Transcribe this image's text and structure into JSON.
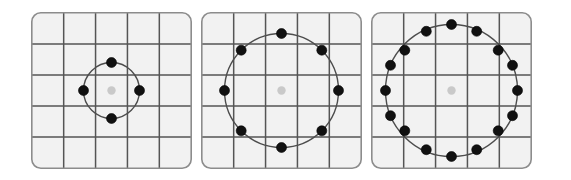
{
  "figure": {
    "title": "",
    "width": 571,
    "height": 180,
    "background": "#ffffff",
    "caption": ""
  },
  "style": {
    "panel_fill": "#f2f2f2",
    "panel_border": "#8c8c8c",
    "panel_border_width": 1.6,
    "panel_corner_radius": 9,
    "grid_color": "#555555",
    "grid_width": 1.5,
    "circle_color": "#4d4d4d",
    "circle_width": 1.4,
    "point_color": "#111111",
    "point_edge_color": "#000000",
    "center_color": "#c9c9c9",
    "center_radius": 4.2,
    "point_radius": 5.0
  },
  "chart_data": {
    "type": "scatter",
    "title": "",
    "subtitle": "",
    "xlabel": "",
    "ylabel": "",
    "legend": [],
    "grid": true,
    "layout": "1x3 panel row",
    "panels": [
      {
        "name": "panel-1",
        "label": "",
        "x": 31,
        "y": 12,
        "width": 161,
        "height": 157,
        "grid_cols": 5,
        "grid_rows": 5,
        "center": {
          "x": 80.5,
          "y": 78.5
        },
        "center_point": {
          "x": 80.5,
          "y": 78.5,
          "color": "#c9c9c9"
        },
        "circle": {
          "cx": 80.5,
          "cy": 78.5,
          "r": 28
        },
        "n_points": 4,
        "angle_step_deg": 90,
        "start_angle_deg": 90,
        "points": [
          {
            "x": 80.5,
            "y": 50.5
          },
          {
            "x": 108.5,
            "y": 78.5
          },
          {
            "x": 80.5,
            "y": 106.5
          },
          {
            "x": 52.5,
            "y": 78.5
          }
        ]
      },
      {
        "name": "panel-2",
        "label": "",
        "x": 201,
        "y": 12,
        "width": 161,
        "height": 157,
        "grid_cols": 5,
        "grid_rows": 5,
        "center": {
          "x": 80.5,
          "y": 78.5
        },
        "center_point": {
          "x": 80.5,
          "y": 78.5,
          "color": "#c9c9c9"
        },
        "circle": {
          "cx": 80.5,
          "cy": 78.5,
          "r": 57
        },
        "n_points": 8,
        "angle_step_deg": 45,
        "start_angle_deg": 90,
        "points": [
          {
            "x": 80.5,
            "y": 21.5
          },
          {
            "x": 120.8,
            "y": 38.2
          },
          {
            "x": 137.5,
            "y": 78.5
          },
          {
            "x": 120.8,
            "y": 118.8
          },
          {
            "x": 80.5,
            "y": 135.5
          },
          {
            "x": 40.2,
            "y": 118.8
          },
          {
            "x": 23.5,
            "y": 78.5
          },
          {
            "x": 40.2,
            "y": 38.2
          }
        ]
      },
      {
        "name": "panel-3",
        "label": "",
        "x": 371,
        "y": 12,
        "width": 161,
        "height": 157,
        "grid_cols": 5,
        "grid_rows": 5,
        "center": {
          "x": 80.5,
          "y": 78.5
        },
        "center_point": {
          "x": 80.5,
          "y": 78.5,
          "color": "#c9c9c9"
        },
        "circle": {
          "cx": 80.5,
          "cy": 78.5,
          "r": 66
        },
        "n_points": 16,
        "angle_step_deg": 22.5,
        "start_angle_deg": 90,
        "points": [
          {
            "x": 80.5,
            "y": 12.5
          },
          {
            "x": 105.7,
            "y": 19.3
          },
          {
            "x": 127.2,
            "y": 38.2
          },
          {
            "x": 141.5,
            "y": 53.3
          },
          {
            "x": 146.5,
            "y": 78.5
          },
          {
            "x": 141.5,
            "y": 103.7
          },
          {
            "x": 127.2,
            "y": 118.8
          },
          {
            "x": 105.7,
            "y": 137.7
          },
          {
            "x": 80.5,
            "y": 144.5
          },
          {
            "x": 55.3,
            "y": 137.7
          },
          {
            "x": 33.8,
            "y": 118.8
          },
          {
            "x": 19.5,
            "y": 103.7
          },
          {
            "x": 14.5,
            "y": 78.5
          },
          {
            "x": 19.5,
            "y": 53.3
          },
          {
            "x": 33.8,
            "y": 38.2
          },
          {
            "x": 55.3,
            "y": 19.3
          }
        ]
      }
    ]
  }
}
